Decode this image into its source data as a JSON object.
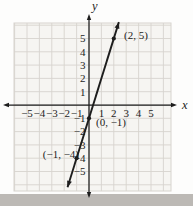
{
  "figure": {
    "width": 193,
    "height": 206,
    "background": "#fdfdfc",
    "page_edge_band": {
      "top": 194,
      "color": "#bcb9b5"
    },
    "grid": {
      "left": 14,
      "top": 23,
      "right": 171,
      "bottom": 191,
      "fill": "#f6f5f2",
      "line_color": "#d7d4ce",
      "units_x": 6,
      "units_y": 6
    },
    "mapping": {
      "origin_x": 89,
      "origin_y": 105,
      "unit_x": 12.4,
      "unit_y": 13.3
    },
    "axes": {
      "color": "#1d1d1d",
      "x_label": "x",
      "y_label": "y",
      "x_tick_labels": [
        "−5",
        "−4",
        "−3",
        "−2",
        "−1",
        "1",
        "2",
        "3",
        "4",
        "5"
      ],
      "y_tick_labels": [
        "5",
        "4",
        "3",
        "2",
        "1",
        "−1",
        "−2",
        "−3",
        "−4",
        "−5"
      ]
    },
    "line_color": "#1d1d1d",
    "point_labels": [
      {
        "text": "(2, 5)",
        "x": 124,
        "y": 39,
        "anchor": "start"
      },
      {
        "text": "(0, −1)",
        "x": 96,
        "y": 126,
        "anchor": "start"
      },
      {
        "text": "(−1, −4)",
        "x": 79,
        "y": 158,
        "anchor": "end"
      }
    ]
  },
  "chart_data": {
    "type": "line",
    "title": "",
    "xlabel": "x",
    "ylabel": "y",
    "xlim": [
      -6,
      6
    ],
    "ylim": [
      -6,
      6
    ],
    "grid": true,
    "x_ticks": [
      -5,
      -4,
      -3,
      -2,
      -1,
      1,
      2,
      3,
      4,
      5
    ],
    "y_ticks": [
      5,
      4,
      3,
      2,
      1,
      -1,
      -2,
      -3,
      -4,
      -5
    ],
    "slope": 3,
    "y_intercept": -1,
    "points": [
      {
        "x": 2,
        "y": 5,
        "label": "(2, 5)"
      },
      {
        "x": 0,
        "y": -1,
        "label": "(0, −1)"
      },
      {
        "x": -1,
        "y": -4,
        "label": "(−1, −4)"
      }
    ],
    "line_extent_x": [
      -1.73,
      2.41
    ]
  }
}
